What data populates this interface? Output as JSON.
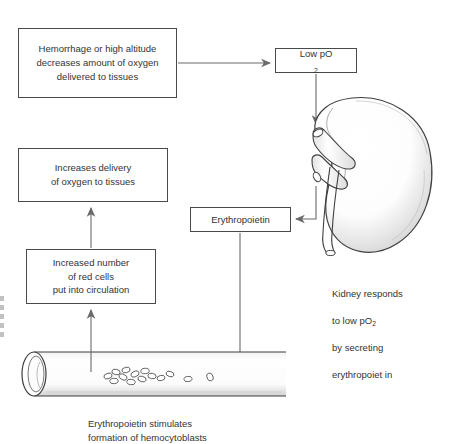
{
  "diagram": {
    "boxes": {
      "stimulus": "Hemorrhage or high altitude\ndecreases amount of oxygen\ndelivered to tissues",
      "low_po2_pre": "Low pO",
      "low_po2_sub": "2",
      "delivery": "Increases delivery\nof oxygen to tissues",
      "red_cells": "Increased number\nof red cells\nput into circulation",
      "erythropoietin": "Erythropoietin"
    },
    "captions": {
      "kidney_line1": "Kidney responds",
      "kidney_line2_pre": "to low pO",
      "kidney_line2_sub": "2",
      "kidney_line3": "by secreting",
      "kidney_line4": "erythropoiet in",
      "vessel": "Erythropoietin stimulates\nformation of hemocytoblasts"
    },
    "illustrations": {
      "kidney": "kidney-illustration",
      "blood_vessel": "blood-vessel-illustration",
      "red_blood_cells": "red-blood-cell-cluster"
    },
    "arrows": [
      {
        "name": "stimulus-to-lowpo2",
        "from": "stimulus",
        "to": "low_po2",
        "direction": "right"
      },
      {
        "name": "lowpo2-to-kidney",
        "from": "low_po2",
        "to": "kidney",
        "direction": "down"
      },
      {
        "name": "kidney-to-erythropoietin",
        "from": "kidney",
        "to": "erythropoietin",
        "direction": "left"
      },
      {
        "name": "erythropoietin-to-vessel",
        "from": "erythropoietin",
        "to": "blood_vessel",
        "direction": "left"
      },
      {
        "name": "vessel-to-redcells",
        "from": "blood_vessel",
        "to": "red_cells",
        "direction": "up"
      },
      {
        "name": "redcells-to-delivery",
        "from": "red_cells",
        "to": "delivery",
        "direction": "up"
      }
    ],
    "colors": {
      "ink": "#4a4a4a",
      "text": "#333333",
      "background": "#ffffff",
      "shading": "#9a9a9a"
    }
  }
}
